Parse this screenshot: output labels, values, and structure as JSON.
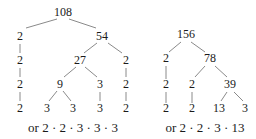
{
  "trees": [
    {
      "id": "factor-tree-108",
      "root": "108",
      "nodes": [
        {
          "id": "n108",
          "label": "108",
          "x": 63,
          "y": 16
        },
        {
          "id": "a2",
          "label": "2",
          "x": 20,
          "y": 40
        },
        {
          "id": "n54",
          "label": "54",
          "x": 102,
          "y": 40
        },
        {
          "id": "b2",
          "label": "2",
          "x": 20,
          "y": 64
        },
        {
          "id": "n27",
          "label": "27",
          "x": 80,
          "y": 64
        },
        {
          "id": "c2r",
          "label": "2",
          "x": 126,
          "y": 64
        },
        {
          "id": "d2",
          "label": "2",
          "x": 20,
          "y": 88
        },
        {
          "id": "n9",
          "label": "9",
          "x": 60,
          "y": 88
        },
        {
          "id": "d3",
          "label": "3",
          "x": 100,
          "y": 88
        },
        {
          "id": "d2r",
          "label": "2",
          "x": 126,
          "y": 88
        },
        {
          "id": "e2",
          "label": "2",
          "x": 20,
          "y": 112
        },
        {
          "id": "e3a",
          "label": "3",
          "x": 47,
          "y": 112
        },
        {
          "id": "e3b",
          "label": "3",
          "x": 73,
          "y": 112
        },
        {
          "id": "e3c",
          "label": "3",
          "x": 100,
          "y": 112
        },
        {
          "id": "e2r",
          "label": "2",
          "x": 126,
          "y": 112
        }
      ],
      "edges": [
        [
          57,
          19,
          26,
          28
        ],
        [
          69,
          19,
          96,
          28
        ],
        [
          20,
          44,
          20,
          53
        ],
        [
          97,
          43,
          84,
          53
        ],
        [
          108,
          43,
          122,
          53
        ],
        [
          20,
          68,
          20,
          77
        ],
        [
          126,
          68,
          126,
          77
        ],
        [
          76,
          67,
          64,
          77
        ],
        [
          85,
          67,
          97,
          77
        ],
        [
          20,
          92,
          20,
          101
        ],
        [
          126,
          92,
          126,
          101
        ],
        [
          100,
          92,
          100,
          101
        ],
        [
          57,
          91,
          49,
          101
        ],
        [
          63,
          91,
          71,
          101
        ]
      ],
      "caption": "or 2 · 2 · 3 · 3 · 3",
      "caption_x": 73,
      "caption_y": 132
    },
    {
      "id": "factor-tree-156",
      "root": "156",
      "nodes": [
        {
          "id": "m156",
          "label": "156",
          "x": 186,
          "y": 38
        },
        {
          "id": "f2",
          "label": "2",
          "x": 166,
          "y": 62
        },
        {
          "id": "m78",
          "label": "78",
          "x": 210,
          "y": 62
        },
        {
          "id": "g2",
          "label": "2",
          "x": 166,
          "y": 88
        },
        {
          "id": "g2b",
          "label": "2",
          "x": 192,
          "y": 88
        },
        {
          "id": "m39",
          "label": "39",
          "x": 230,
          "y": 88
        },
        {
          "id": "h2",
          "label": "2",
          "x": 166,
          "y": 112
        },
        {
          "id": "h2b",
          "label": "2",
          "x": 192,
          "y": 112
        },
        {
          "id": "m13",
          "label": "13",
          "x": 219,
          "y": 112
        },
        {
          "id": "h3",
          "label": "3",
          "x": 245,
          "y": 112
        }
      ],
      "edges": [
        [
          181,
          42,
          169,
          52
        ],
        [
          191,
          42,
          205,
          52
        ],
        [
          205,
          66,
          195,
          77
        ],
        [
          215,
          66,
          227,
          77
        ],
        [
          166,
          66,
          166,
          79
        ],
        [
          166,
          92,
          166,
          103
        ],
        [
          192,
          92,
          192,
          103
        ],
        [
          227,
          92,
          221,
          101
        ],
        [
          234,
          92,
          243,
          101
        ]
      ],
      "caption": "or 2 · 2 · 3 · 13",
      "caption_x": 205,
      "caption_y": 132
    }
  ]
}
